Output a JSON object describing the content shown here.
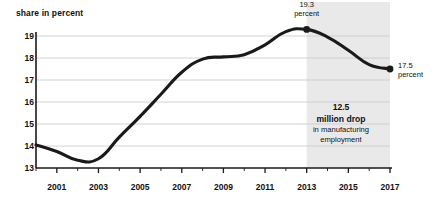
{
  "chart_data": {
    "type": "line",
    "title": "",
    "ylabel": "share in percent",
    "xlabel": "",
    "ylim": [
      13,
      19.4
    ],
    "xlim": [
      2000,
      2017
    ],
    "grid": true,
    "legend": "none",
    "ytick_labels": [
      "13",
      "14",
      "15",
      "16",
      "17",
      "18",
      "19"
    ],
    "ytick_values": [
      13,
      14,
      15,
      16,
      17,
      18,
      19
    ],
    "xtick_labels": [
      "2001",
      "2003",
      "2005",
      "2007",
      "2009",
      "2011",
      "2013",
      "2015",
      "2017"
    ],
    "xtick_values": [
      2001,
      2003,
      2005,
      2007,
      2009,
      2011,
      2013,
      2015,
      2017
    ],
    "minor_xtick_values": [
      2000,
      2002,
      2004,
      2006,
      2008,
      2010,
      2012,
      2014,
      2016
    ],
    "x": [
      2000,
      2001,
      2002,
      2003,
      2004,
      2005,
      2006,
      2007,
      2008,
      2009,
      2010,
      2011,
      2012,
      2013,
      2014,
      2015,
      2016,
      2017
    ],
    "values": [
      14.05,
      13.75,
      13.35,
      13.42,
      14.4,
      15.35,
      16.35,
      17.35,
      17.95,
      18.05,
      18.15,
      18.6,
      19.2,
      19.3,
      18.95,
      18.35,
      17.7,
      17.5
    ],
    "series": [
      {
        "name": "share in percent",
        "values": [
          14.05,
          13.75,
          13.35,
          13.42,
          14.4,
          15.35,
          16.35,
          17.35,
          17.95,
          18.05,
          18.15,
          18.6,
          19.2,
          19.3,
          18.95,
          18.35,
          17.7,
          17.5
        ]
      }
    ],
    "markers": [
      {
        "name": "peak-2013",
        "x": 2013,
        "y": 19.3,
        "label_value": "19.3",
        "label_unit": "percent"
      },
      {
        "name": "end-2017",
        "x": 2017,
        "y": 17.5,
        "label_value": "17.5",
        "label_unit": "percent"
      }
    ],
    "shaded_region": {
      "x_start": 2013,
      "x_end": 2017,
      "color": "#e9e9e9"
    },
    "annotations": [
      {
        "name": "drop-callout",
        "line1": "12.5",
        "line2": "million drop",
        "line3": "in manufacturing",
        "line4": "employment"
      }
    ],
    "colors": {
      "line": "#1a1a1a",
      "grid": "#c8c8c8",
      "axis": "#1a1a1a",
      "shade": "#e9e9e9",
      "text": "#111111",
      "background": "#ffffff"
    }
  }
}
